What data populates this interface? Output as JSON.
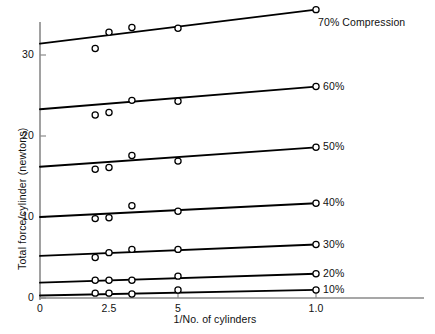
{
  "chart_data": {
    "type": "scatter",
    "title": "",
    "xlabel": "1/No. of cylinders",
    "ylabel": "Total force/cylinder (newtons)",
    "xlim": [
      0,
      1.0
    ],
    "ylim": [
      0,
      36
    ],
    "grid": false,
    "legend_position": "right-of-line-ends",
    "xticks": [
      {
        "value": 0,
        "label": "0"
      },
      {
        "value": 0.25,
        "label": "2.5"
      },
      {
        "value": 0.5,
        "label": "5"
      },
      {
        "value": 1.0,
        "label": "1.0"
      }
    ],
    "yticks": [
      {
        "value": 0,
        "label": "0"
      },
      {
        "value": 10,
        "label": "10"
      },
      {
        "value": 20,
        "label": "20"
      },
      {
        "value": 30,
        "label": "30"
      }
    ],
    "series": [
      {
        "name": "70% Compression",
        "label": "70% Compression",
        "line": {
          "x0": 0.0,
          "y0": 31.4,
          "x1": 1.0,
          "y1": 35.6
        },
        "points": [
          {
            "x": 0.2,
            "y": 30.8
          },
          {
            "x": 0.25,
            "y": 32.8
          },
          {
            "x": 0.333,
            "y": 33.4
          },
          {
            "x": 0.5,
            "y": 33.3
          },
          {
            "x": 1.0,
            "y": 35.6
          }
        ]
      },
      {
        "name": "60%",
        "label": "60%",
        "line": {
          "x0": 0.0,
          "y0": 23.3,
          "x1": 1.0,
          "y1": 26.1
        },
        "points": [
          {
            "x": 0.2,
            "y": 22.6
          },
          {
            "x": 0.25,
            "y": 22.9
          },
          {
            "x": 0.333,
            "y": 24.4
          },
          {
            "x": 0.5,
            "y": 24.3
          },
          {
            "x": 1.0,
            "y": 26.1
          }
        ]
      },
      {
        "name": "50%",
        "label": "50%",
        "line": {
          "x0": 0.0,
          "y0": 16.2,
          "x1": 1.0,
          "y1": 18.6
        },
        "points": [
          {
            "x": 0.2,
            "y": 15.9
          },
          {
            "x": 0.25,
            "y": 16.1
          },
          {
            "x": 0.333,
            "y": 17.6
          },
          {
            "x": 0.5,
            "y": 16.9
          },
          {
            "x": 1.0,
            "y": 18.6
          }
        ]
      },
      {
        "name": "40%",
        "label": "40%",
        "line": {
          "x0": 0.0,
          "y0": 10.0,
          "x1": 1.0,
          "y1": 11.7
        },
        "points": [
          {
            "x": 0.2,
            "y": 9.8
          },
          {
            "x": 0.25,
            "y": 9.9
          },
          {
            "x": 0.333,
            "y": 11.4
          },
          {
            "x": 0.5,
            "y": 10.7
          },
          {
            "x": 1.0,
            "y": 11.7
          }
        ]
      },
      {
        "name": "30%",
        "label": "30%",
        "line": {
          "x0": 0.0,
          "y0": 5.2,
          "x1": 1.0,
          "y1": 6.6
        },
        "points": [
          {
            "x": 0.2,
            "y": 5.0
          },
          {
            "x": 0.25,
            "y": 5.6
          },
          {
            "x": 0.333,
            "y": 6.0
          },
          {
            "x": 0.5,
            "y": 6.0
          },
          {
            "x": 1.0,
            "y": 6.6
          }
        ]
      },
      {
        "name": "20%",
        "label": "20%",
        "line": {
          "x0": 0.0,
          "y0": 1.9,
          "x1": 1.0,
          "y1": 3.0
        },
        "points": [
          {
            "x": 0.2,
            "y": 2.2
          },
          {
            "x": 0.25,
            "y": 2.2
          },
          {
            "x": 0.333,
            "y": 2.2
          },
          {
            "x": 0.5,
            "y": 2.7
          },
          {
            "x": 1.0,
            "y": 3.0
          }
        ]
      },
      {
        "name": "10%",
        "label": "10%",
        "line": {
          "x0": 0.0,
          "y0": 0.3,
          "x1": 1.0,
          "y1": 1.0
        },
        "points": [
          {
            "x": 0.2,
            "y": 0.6
          },
          {
            "x": 0.25,
            "y": 0.6
          },
          {
            "x": 0.333,
            "y": 0.5
          },
          {
            "x": 0.5,
            "y": 1.0
          },
          {
            "x": 1.0,
            "y": 1.0
          }
        ]
      }
    ],
    "colors": {
      "line": "#000000",
      "marker_stroke": "#000000",
      "marker_fill": "#ffffff",
      "axis": "#8a8a8a",
      "text": "#111111"
    }
  }
}
